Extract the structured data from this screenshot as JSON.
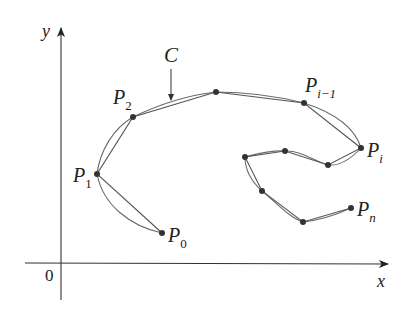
{
  "figure": {
    "type": "polygonal approximation of a curve",
    "axes": {
      "x_label": "x",
      "y_label": "y",
      "origin_label": "0",
      "axis_color": "#333333"
    },
    "curve": {
      "label": "C",
      "color": "#666666"
    },
    "polygon": {
      "color": "#555555",
      "point_color": "#333333"
    },
    "points": [
      {
        "name": "P0",
        "base": "P",
        "sub": "0",
        "x": 162,
        "y": 233,
        "labeled": true
      },
      {
        "name": "P1",
        "base": "P",
        "sub": "1",
        "x": 97,
        "y": 174,
        "labeled": true
      },
      {
        "name": "P2",
        "base": "P",
        "sub": "2",
        "x": 133,
        "y": 117,
        "labeled": true
      },
      {
        "name": "",
        "x": 216,
        "y": 92,
        "labeled": false
      },
      {
        "name": "Pi-1",
        "base": "P",
        "sub": "i−1",
        "x": 304,
        "y": 103,
        "labeled": true
      },
      {
        "name": "Pi",
        "base": "P",
        "sub": "i",
        "x": 361,
        "y": 148,
        "labeled": true
      },
      {
        "name": "",
        "x": 328,
        "y": 165,
        "labeled": false
      },
      {
        "name": "",
        "x": 285,
        "y": 151,
        "labeled": false
      },
      {
        "name": "",
        "x": 245,
        "y": 157,
        "labeled": false
      },
      {
        "name": "",
        "x": 262,
        "y": 191,
        "labeled": false
      },
      {
        "name": "",
        "x": 303,
        "y": 222,
        "labeled": false
      },
      {
        "name": "Pn",
        "base": "P",
        "sub": "n",
        "x": 351,
        "y": 208,
        "labeled": true
      }
    ],
    "labels": {
      "P0": {
        "base": "P",
        "sub": "0"
      },
      "P1": {
        "base": "P",
        "sub": "1"
      },
      "P2": {
        "base": "P",
        "sub": "2"
      },
      "Pim1": {
        "base": "P",
        "sub": "i−1"
      },
      "Pi": {
        "base": "P",
        "sub": "i"
      },
      "Pn": {
        "base": "P",
        "sub": "n"
      }
    }
  }
}
